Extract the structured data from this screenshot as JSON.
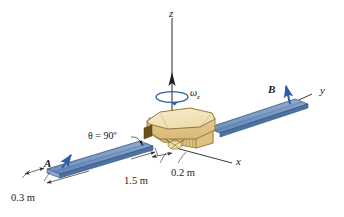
{
  "figure": {
    "type": "engineering-mechanics-diagram",
    "background_color": "#ffffff"
  },
  "axes": {
    "z": {
      "label": "z",
      "description": "vertical spin axis pointing up"
    },
    "y": {
      "label": "y",
      "description": "axis along the solar panel span to the upper right"
    },
    "x": {
      "label": "x",
      "description": "axis toward the lower right viewer"
    }
  },
  "angular_velocity": {
    "label": "ω",
    "subscript": "z",
    "description": "spin about the z axis shown by a circular arrow",
    "color": "#2c5fa8"
  },
  "points": [
    {
      "name": "A",
      "label": "A",
      "description": "tip region of the left solar panel"
    },
    {
      "name": "B",
      "label": "B",
      "description": "tip region of the right solar panel"
    }
  ],
  "panel_arrows": [
    {
      "at": "A",
      "description": "blue velocity arrow at panel A",
      "color": "#2c5fa8"
    },
    {
      "at": "B",
      "description": "blue velocity arrow at panel B",
      "color": "#2c5fa8"
    }
  ],
  "angle": {
    "label": "θ = 90º",
    "value": 90,
    "unit": "degrees",
    "description": "panel orientation angle measured at the left panel root"
  },
  "dimensions": [
    {
      "label": "0.3 m",
      "value": 0.3,
      "unit": "m",
      "description": "panel width at outboard end of left panel"
    },
    {
      "label": "1.5 m",
      "value": 1.5,
      "unit": "m",
      "description": "length of the solar panel from body to tip"
    },
    {
      "label": "0.2 m",
      "value": 0.2,
      "unit": "m",
      "description": "half width / offset at the satellite body"
    }
  ],
  "bodies": {
    "satellite_body": {
      "name": "octagonal satellite bus",
      "top_color": "#f5e3b8",
      "side_color": "#e8cf95",
      "shadow_color": "#d8b870",
      "edge_color": "#8a6a2a"
    },
    "solar_panels": {
      "name": "solar panels",
      "top_color": "#7e9cc4",
      "face_color": "#5d82b4",
      "edge_color": "#2f4f7a",
      "side_color": "#9fb6d4"
    }
  },
  "colors": {
    "accent_blue": "#2c5fa8",
    "axis_line": "#3a3a3a",
    "dimension_line": "#2a2a2a"
  }
}
